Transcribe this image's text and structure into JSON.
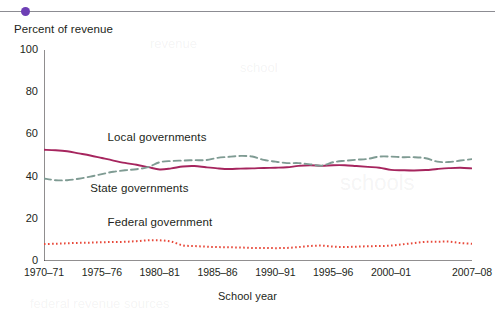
{
  "header": {
    "bullet_color": "#6d3fb5",
    "rule_color": "#8c8c92"
  },
  "chart_data": {
    "type": "line",
    "title": "",
    "xlabel": "School year",
    "ylabel": "Percent of revenue",
    "ylim": [
      0,
      100
    ],
    "yticks": [
      0,
      20,
      40,
      60,
      80,
      100
    ],
    "yticklabels": [
      "0",
      "20",
      "40",
      "60",
      "80",
      "100"
    ],
    "minor_y_step": 10,
    "grid": false,
    "legend_position": "inline-annotations",
    "xlim": [
      1970,
      2007
    ],
    "xticks": [
      1970,
      1975,
      1980,
      1985,
      1990,
      1995,
      2000,
      2007
    ],
    "xticklabels": [
      "1970–71",
      "1975–76",
      "1980–81",
      "1985–86",
      "1990–91",
      "1995–96",
      "2000–01",
      "2007–08"
    ],
    "x": [
      1970,
      1971,
      1972,
      1973,
      1974,
      1975,
      1976,
      1977,
      1978,
      1979,
      1980,
      1981,
      1982,
      1983,
      1984,
      1985,
      1986,
      1987,
      1988,
      1989,
      1990,
      1991,
      1992,
      1993,
      1994,
      1995,
      1996,
      1997,
      1998,
      1999,
      2000,
      2001,
      2002,
      2003,
      2004,
      2005,
      2006,
      2007
    ],
    "series": [
      {
        "name": "Local governments",
        "color": "#a6255e",
        "style": "solid",
        "values": [
          52.7,
          52.5,
          52.0,
          51.0,
          50.0,
          48.8,
          47.6,
          46.5,
          45.6,
          44.5,
          43.4,
          43.9,
          44.8,
          45.0,
          44.4,
          43.9,
          43.6,
          43.8,
          43.9,
          44.1,
          44.2,
          44.4,
          45.1,
          45.4,
          45.1,
          45.4,
          45.4,
          45.0,
          44.6,
          44.2,
          43.2,
          43.0,
          42.9,
          43.1,
          43.6,
          44.0,
          44.2,
          43.9
        ],
        "label_position": {
          "x": 1975.5,
          "y": 58.0
        }
      },
      {
        "name": "State governments",
        "color": "#7f9b93",
        "style": "dashed",
        "values": [
          39.1,
          38.3,
          38.3,
          39.0,
          40.0,
          41.2,
          42.3,
          43.0,
          43.5,
          44.5,
          46.8,
          47.4,
          47.6,
          47.8,
          47.8,
          48.9,
          49.4,
          49.8,
          49.5,
          47.9,
          47.1,
          46.4,
          46.4,
          45.8,
          45.2,
          46.8,
          47.5,
          48.0,
          48.4,
          49.5,
          49.5,
          49.2,
          49.2,
          48.7,
          47.1,
          46.9,
          47.6,
          48.3
        ],
        "label_position": {
          "x": 1974.0,
          "y": 33.5
        }
      },
      {
        "name": "Federal government",
        "color": "#e8493a",
        "style": "dotted",
        "values": [
          8.0,
          8.2,
          8.4,
          8.6,
          8.7,
          8.9,
          9.0,
          9.1,
          9.4,
          9.8,
          9.8,
          9.2,
          7.4,
          7.1,
          6.8,
          6.6,
          6.5,
          6.4,
          6.2,
          6.2,
          6.1,
          6.2,
          6.6,
          7.1,
          7.3,
          6.8,
          6.6,
          6.8,
          7.0,
          7.1,
          7.3,
          7.9,
          8.5,
          9.1,
          9.1,
          9.2,
          8.5,
          8.2
        ],
        "label_position": {
          "x": 1975.5,
          "y": 17.5
        }
      }
    ]
  }
}
